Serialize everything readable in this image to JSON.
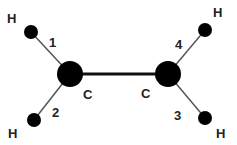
{
  "diagram": {
    "title": "",
    "atoms": [
      {
        "id": "C1",
        "element": "C",
        "label": "C",
        "x": 70,
        "y": 74,
        "r": 13
      },
      {
        "id": "C2",
        "element": "C",
        "label": "C",
        "x": 168,
        "y": 74,
        "r": 13
      },
      {
        "id": "H1",
        "element": "H",
        "label": "H",
        "x": 31,
        "y": 32,
        "r": 7
      },
      {
        "id": "H2",
        "element": "H",
        "label": "H",
        "x": 34,
        "y": 120,
        "r": 7
      },
      {
        "id": "H3",
        "element": "H",
        "label": "H",
        "x": 205,
        "y": 118,
        "r": 7
      },
      {
        "id": "H4",
        "element": "H",
        "label": "H",
        "x": 205,
        "y": 30,
        "r": 7
      }
    ],
    "bonds": [
      {
        "from": "C1",
        "to": "C2",
        "label": ""
      },
      {
        "from": "C1",
        "to": "H1",
        "label": "1"
      },
      {
        "from": "C1",
        "to": "H2",
        "label": "2"
      },
      {
        "from": "C2",
        "to": "H3",
        "label": "3"
      },
      {
        "from": "C2",
        "to": "H4",
        "label": "4"
      }
    ],
    "labels": {
      "h_top_left": "H",
      "h_bottom_left": "H",
      "h_top_right": "H",
      "h_bottom_right": "H",
      "c_left": "C",
      "c_right": "C",
      "bond_1": "1",
      "bond_2": "2",
      "bond_3": "3",
      "bond_4": "4"
    },
    "colors": {
      "atom": "#000000",
      "bond": "#555555",
      "cc_bond": "#111111",
      "text": "#222222"
    }
  }
}
